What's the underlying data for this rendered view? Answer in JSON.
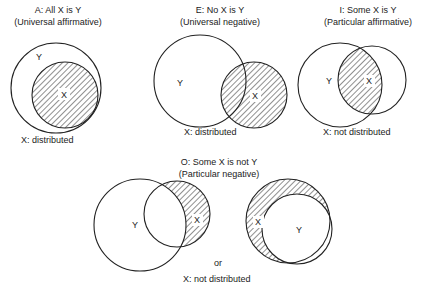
{
  "diagrams": [
    {
      "id": "A",
      "title": "A: All X is Y",
      "subtitle": "(Universal affirmative)",
      "label_y": "Y",
      "label_x": "X",
      "caption": "X: distributed"
    },
    {
      "id": "E",
      "title": "E: No X is Y",
      "subtitle": "(Universal negative)",
      "label_y": "Y",
      "label_x": "X",
      "caption": "X: distributed"
    },
    {
      "id": "I",
      "title": "I: Some X is Y",
      "subtitle": "(Particular affirmative)",
      "label_y": "Y",
      "label_x": "X",
      "caption": "X: not distributed"
    },
    {
      "id": "O",
      "title": "O: Some X is not Y",
      "subtitle": "(Particular negative)",
      "left": {
        "label_y": "Y",
        "label_x": "X"
      },
      "right": {
        "label_y": "Y",
        "label_x": "X"
      },
      "connector": "or",
      "caption": "X: not distributed"
    }
  ],
  "colors": {
    "stroke": "#222222",
    "hatch": "#222222",
    "background": "#ffffff"
  }
}
